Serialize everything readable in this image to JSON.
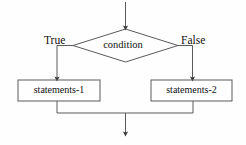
{
  "diagram": {
    "type": "flowchart",
    "stroke_color": "#5a5a5a",
    "text_color": "#111111",
    "background_color": "#fefefe",
    "nodes": {
      "decision": {
        "shape": "diamond",
        "label": "condition"
      },
      "branch_true": {
        "shape": "rectangle",
        "label": "statements-1"
      },
      "branch_false": {
        "shape": "rectangle",
        "label": "statements-2"
      }
    },
    "edges": {
      "entry": {
        "label": "",
        "arrow": true
      },
      "true_branch": {
        "label": "True",
        "arrow": true
      },
      "false_branch": {
        "label": "False",
        "arrow": true
      },
      "exit": {
        "label": "",
        "arrow": true
      }
    }
  }
}
